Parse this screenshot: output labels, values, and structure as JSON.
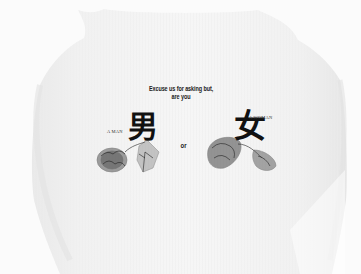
{
  "image": {
    "subject": "Back of a white ribbed tank top with printed text and botanical illustrations",
    "background_color": "#ffffff",
    "garment_color": "#f3f3f3"
  },
  "print": {
    "headline_line1": "Excuse us for asking but,",
    "headline_line2": "are you",
    "man": {
      "label": "A MAN",
      "kanji": "男"
    },
    "connector": "or",
    "woman": {
      "label": "A WOMAN",
      "kanji": "女"
    },
    "ink_color": "#111111"
  }
}
